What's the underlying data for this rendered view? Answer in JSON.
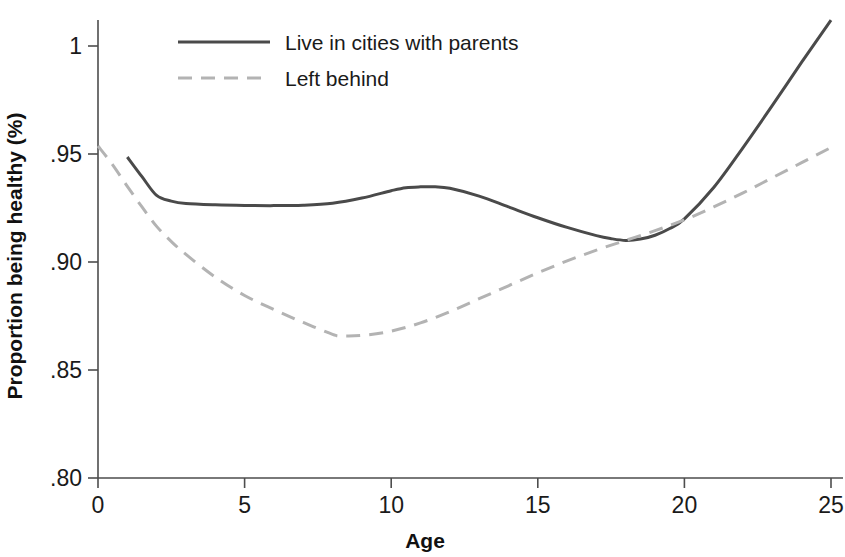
{
  "figure": {
    "background": "#ffffff",
    "width": 845,
    "height": 557
  },
  "chart_data": {
    "type": "line",
    "title": "",
    "xlabel": "Age",
    "ylabel": "Proportion being healthy (%)",
    "xlim": [
      0,
      25
    ],
    "ylim": [
      0.8,
      1.0
    ],
    "xticks": [
      0,
      5,
      10,
      15,
      20,
      25
    ],
    "xtick_labels": [
      "0",
      "5",
      "10",
      "15",
      "20",
      "25"
    ],
    "yticks": [
      0.8,
      0.85,
      0.9,
      0.95,
      1.0
    ],
    "ytick_labels": [
      ".80",
      ".85",
      ".90",
      ".95",
      "1"
    ],
    "grid": false,
    "legend_position": "top-left-inside",
    "series": [
      {
        "name": "Live in cities with parents",
        "style": "solid",
        "color": "#4a4a4a",
        "width": 3.0,
        "x": [
          1,
          1.5,
          2,
          2.5,
          3,
          4,
          5,
          6,
          7,
          8,
          9,
          10,
          10.5,
          11,
          11.5,
          12,
          13,
          14,
          15,
          16,
          17,
          17.5,
          18,
          18.5,
          19,
          19.5,
          20,
          21,
          22,
          23,
          24,
          25
        ],
        "y": [
          0.9486,
          0.9395,
          0.9308,
          0.9282,
          0.9271,
          0.9265,
          0.9262,
          0.9261,
          0.9263,
          0.9272,
          0.9296,
          0.933,
          0.9344,
          0.9348,
          0.9348,
          0.9341,
          0.9305,
          0.9255,
          0.9205,
          0.916,
          0.9122,
          0.9108,
          0.91,
          0.9106,
          0.9124,
          0.9155,
          0.92,
          0.9345,
          0.953,
          0.9725,
          0.9925,
          1.012
        ]
      },
      {
        "name": "Left behind",
        "style": "dashed",
        "color": "#b3b3b3",
        "width": 3.0,
        "dash": "14 9",
        "x": [
          0,
          0.5,
          1,
          1.5,
          2,
          2.5,
          3,
          4,
          5,
          6,
          7,
          8,
          8.3,
          9,
          10,
          11,
          12,
          13,
          14,
          15,
          16,
          17,
          18,
          19,
          20,
          21,
          22,
          23,
          24,
          25
        ],
        "y": [
          0.9537,
          0.945,
          0.935,
          0.9255,
          0.9165,
          0.9095,
          0.9035,
          0.893,
          0.8845,
          0.878,
          0.872,
          0.8665,
          0.8658,
          0.866,
          0.868,
          0.8718,
          0.877,
          0.883,
          0.889,
          0.895,
          0.9005,
          0.9055,
          0.91,
          0.9145,
          0.9195,
          0.9255,
          0.932,
          0.939,
          0.946,
          0.953
        ]
      }
    ],
    "annotations": []
  },
  "legend": {
    "entries": [
      {
        "label": "Live in cities with parents",
        "swatch": "solid-dark-line"
      },
      {
        "label": "Left behind",
        "swatch": "dashed-gray-line"
      }
    ]
  }
}
